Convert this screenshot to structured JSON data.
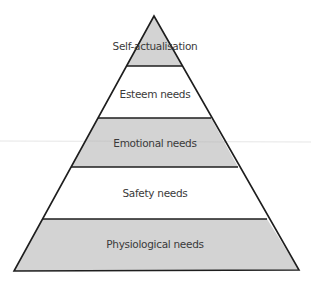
{
  "diagram": {
    "type": "pyramid",
    "colors": {
      "filled_layer": "#d3d3d3",
      "unfilled_layer": "#ffffff",
      "outline": "#1e1e1e",
      "text": "#3a3a3a"
    },
    "layers": [
      {
        "label": "Self-actualisation",
        "filled": true
      },
      {
        "label": "Esteem needs",
        "filled": false
      },
      {
        "label": "Emotional needs",
        "filled": true
      },
      {
        "label": "Safety needs",
        "filled": false
      },
      {
        "label": "Physiological needs",
        "filled": true
      }
    ]
  }
}
